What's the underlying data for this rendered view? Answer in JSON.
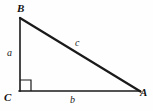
{
  "figure": {
    "kind": "right-triangle-diagram",
    "background_color": "#fefefe",
    "stroke_color": "#1a1a1a",
    "width": 153,
    "height": 111,
    "vertices": [
      {
        "id": "B",
        "label": "B",
        "x": 20,
        "y": 18,
        "label_x": 17,
        "label_y": 3
      },
      {
        "id": "C",
        "label": "C",
        "x": 20,
        "y": 91,
        "label_x": 4,
        "label_y": 92
      },
      {
        "id": "A",
        "label": "A",
        "x": 140,
        "y": 91,
        "label_x": 140,
        "label_y": 87
      }
    ],
    "sides": [
      {
        "id": "a",
        "label": "a",
        "from": "B",
        "to": "C",
        "role": "vertical-leg",
        "label_x": 7,
        "label_y": 48,
        "stroke_width": 1.6
      },
      {
        "id": "b",
        "label": "b",
        "from": "C",
        "to": "A",
        "role": "horizontal-leg",
        "label_x": 70,
        "label_y": 95,
        "stroke_width": 1.6
      },
      {
        "id": "c",
        "label": "c",
        "from": "B",
        "to": "A",
        "role": "hypotenuse",
        "label_x": 75,
        "label_y": 38,
        "stroke_width": 2.2
      }
    ],
    "right_angle": {
      "at_vertex": "C",
      "marker": "square",
      "size": 11,
      "stroke_width": 1.2
    }
  }
}
